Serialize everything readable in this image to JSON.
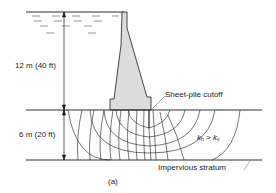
{
  "figure": {
    "caption": "(a)",
    "labels": {
      "upper_height": "12 m (40 ft)",
      "lower_depth": "6 m (20 ft)",
      "sheet_pile": "Sheet-pile cutoff",
      "impervious": "Impervious stratum",
      "permeability": {
        "k1": "k",
        "k1_sub": "h",
        "op": " > ",
        "k2": "k",
        "k2_sub": "v"
      }
    },
    "colors": {
      "line": "#1a1a1a",
      "dam_fill": "#dcdcdc",
      "water_dash": "#555555",
      "background": "#ffffff"
    }
  }
}
